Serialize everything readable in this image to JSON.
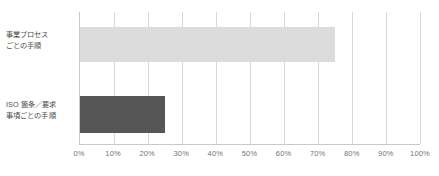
{
  "chart_data": {
    "type": "bar",
    "orientation": "horizontal",
    "title": "",
    "xlabel": "",
    "ylabel": "",
    "categories": [
      "事業プロセス\nごとの手順",
      "ISO 箇条／要求\n事項ごとの手順"
    ],
    "values": [
      75,
      25
    ],
    "value_suffix": "%",
    "xlim": [
      0,
      100
    ],
    "xticks": [
      0,
      10,
      20,
      30,
      40,
      50,
      60,
      70,
      80,
      90,
      100
    ],
    "xtick_labels": [
      "0%",
      "10%",
      "20%",
      "30%",
      "40%",
      "50%",
      "60%",
      "70%",
      "80%",
      "90%",
      "100%"
    ],
    "grid": true,
    "grid_axis": "x",
    "legend": false,
    "bar_colors": [
      "#dcdcdc",
      "#565656"
    ],
    "axis_color": "#c9c9c9",
    "gridline_color": "#d8d8d8",
    "label_color": "#4c4c4c",
    "tick_color": "#757575",
    "background": "#ffffff"
  }
}
